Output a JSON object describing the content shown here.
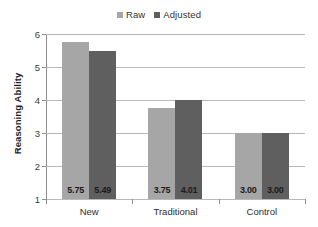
{
  "chart_data": {
    "type": "bar",
    "title": "",
    "subtitle": "",
    "xlabel": "",
    "ylabel": "Reasoning Ability",
    "categories": [
      "New",
      "Traditional",
      "Control"
    ],
    "series": [
      {
        "name": "Raw",
        "color": "#a6a6a6",
        "values": [
          5.75,
          3.75,
          3.0
        ],
        "labels": [
          "5.75",
          "3.75",
          "3.00"
        ]
      },
      {
        "name": "Adjusted",
        "color": "#5f5f5f",
        "values": [
          5.49,
          4.01,
          3.0
        ],
        "labels": [
          "5.49",
          "4.01",
          "3.00"
        ]
      }
    ],
    "ylim": [
      1,
      6
    ],
    "yticks": [
      1,
      2,
      3,
      4,
      5,
      6
    ],
    "ytick_labels": [
      "1",
      "2",
      "3",
      "4",
      "5",
      "6"
    ],
    "grid": "horizontal",
    "legend_position": "top-center",
    "gridline_color": "#b9b9b9",
    "axis_color": "#8f8f8f",
    "background": "#ffffff"
  }
}
